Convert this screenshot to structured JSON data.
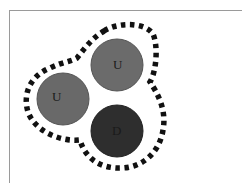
{
  "diagram": {
    "title": "",
    "boundary": {
      "style": "dashed",
      "color": "#111111"
    },
    "quarks": [
      {
        "label": "U",
        "type": "up",
        "color": "#6b6b6b",
        "cx": 117,
        "cy": 65,
        "r": 26
      },
      {
        "label": "U",
        "type": "up",
        "color": "#696969",
        "cx": 63,
        "cy": 99,
        "r": 26
      },
      {
        "label": "D",
        "type": "down",
        "color": "#2e2e2e",
        "cx": 117,
        "cy": 131,
        "r": 26
      }
    ],
    "colors": {
      "label": "#1a1a1a",
      "frame": "#9a9a9a",
      "background": "#ffffff"
    }
  }
}
